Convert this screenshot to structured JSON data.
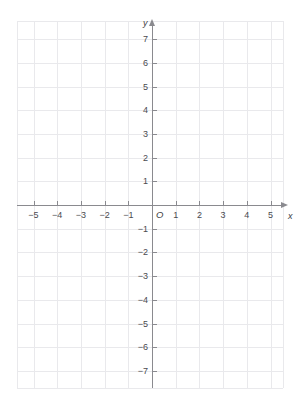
{
  "chart_data": {
    "type": "scatter",
    "title": "",
    "subtitle": "",
    "xlabel": "x",
    "ylabel": "y",
    "origin_label": "O",
    "xlim": [
      -5.7,
      5.55
    ],
    "ylim": [
      -7.78,
      7.78
    ],
    "x_ticks": [
      -5,
      -4,
      -3,
      -2,
      -1,
      1,
      2,
      3,
      4,
      5
    ],
    "y_ticks": [
      7,
      6,
      5,
      4,
      3,
      2,
      1,
      -1,
      -2,
      -3,
      -4,
      -5,
      -6,
      -7
    ],
    "x_tick_labels": [
      "−5",
      "−4",
      "−3",
      "−2",
      "−1",
      "1",
      "2",
      "3",
      "4",
      "5"
    ],
    "y_tick_labels": [
      "7",
      "6",
      "5",
      "4",
      "3",
      "2",
      "1",
      "−1",
      "−2",
      "−3",
      "−4",
      "−5",
      "−6",
      "−7"
    ],
    "grid": true,
    "grid_step": 1,
    "legend": [],
    "series": [],
    "annotations": [],
    "colors": {
      "axis": "#8a8a8f",
      "grid": "#e9e9ec",
      "label": "#4a4a4f",
      "background": "#ffffff"
    }
  },
  "geometry": {
    "origin_px": {
      "x": 152,
      "y": 205
    },
    "unit_px": 23.7,
    "grid_bounds_px": {
      "left": 17,
      "right": 283,
      "top": 21,
      "bottom": 388
    }
  }
}
